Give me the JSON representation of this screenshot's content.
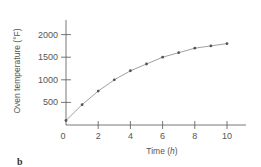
{
  "chart_data": {
    "type": "line",
    "title": "",
    "xlabel": "Time (h)",
    "ylabel": "Oven temperature (°F)",
    "x": [
      0,
      1,
      2,
      3,
      4,
      5,
      6,
      7,
      8,
      9,
      10
    ],
    "series": [
      {
        "name": "Oven temperature",
        "values": [
          100,
          450,
          750,
          1000,
          1200,
          1350,
          1500,
          1600,
          1700,
          1750,
          1800
        ]
      }
    ],
    "xlim": [
      0,
      11
    ],
    "ylim": [
      0,
      2250
    ],
    "xticks": [
      0,
      2,
      4,
      6,
      8,
      10
    ],
    "yticks": [
      500,
      1000,
      1500,
      2000
    ],
    "grid": false,
    "legend": "none",
    "markers": true
  },
  "panel_label": "b",
  "colors": {
    "line": "#888888",
    "marker": "#555555",
    "axis": "#555555"
  }
}
